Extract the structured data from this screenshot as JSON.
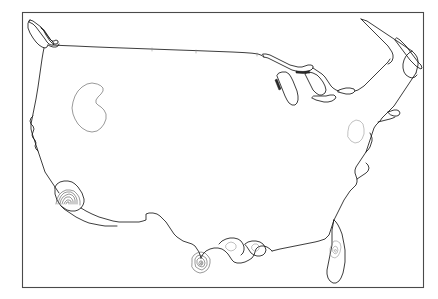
{
  "figure": {
    "title": "",
    "width": 438,
    "height": 299,
    "background_color": "#ffffff",
    "frame": {
      "visible": true,
      "color": "#4a4a4a",
      "stroke_width": 1.1,
      "x": 22,
      "y": 12,
      "width": 401,
      "height": 275
    }
  },
  "chart_data": {
    "type": "map",
    "projection": "equal-area (conic)",
    "region": "Contiguous United States",
    "title": "",
    "xlabel": "",
    "ylabel": "",
    "grid": false,
    "legend": "none",
    "axis_ticks": "none",
    "basemap": {
      "line_color": "#1a1a1a",
      "line_width": 0.85,
      "fill": "none",
      "features": [
        "national-outline",
        "us-canada-border",
        "great-lakes",
        "coastline"
      ]
    },
    "contour_overlays": [
      {
        "name": "great-basin-loop",
        "style": "closed-contour",
        "color": "#555555",
        "center": [
          90,
          105
        ],
        "levels": 1,
        "description": "Single closed teardrop contour over the Great Basin / Nevada"
      },
      {
        "name": "southern-california-nest",
        "style": "nested-contours",
        "color": "#555555",
        "center": [
          68,
          203
        ],
        "levels": 6,
        "description": "Nested concentric arcs centered near Southern California"
      },
      {
        "name": "south-texas-nest",
        "style": "nested-contours",
        "color": "#555555",
        "center": [
          203,
          268
        ],
        "levels": 5,
        "description": "Nested concentric arcs near the Rio Grande delta / South Texas"
      },
      {
        "name": "chesapeake-oval",
        "style": "closed-contour",
        "color": "#8d8d8d",
        "center": [
          353,
          134
        ],
        "levels": 1,
        "description": "Oval contour over the mid-Atlantic / Chesapeake region"
      },
      {
        "name": "florida-interior",
        "style": "faint-contours",
        "color": "#8d8d8d",
        "center": [
          336,
          238
        ],
        "levels": 3,
        "description": "Faint interior contours over the Florida peninsula"
      },
      {
        "name": "gulf-coast-lobes",
        "style": "faint-contours",
        "color": "#8d8d8d",
        "center": [
          240,
          238
        ],
        "levels": 2,
        "description": "Faint lobes along the central Gulf coast"
      }
    ]
  },
  "map": {
    "name": "us-outline-map",
    "accent_color": "#1a1a1a",
    "frame_color": "#4a4a4a"
  }
}
